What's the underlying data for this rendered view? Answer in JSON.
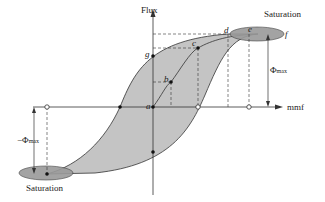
{
  "diagram": {
    "type": "hysteresis-loop",
    "axes": {
      "y_label": "Flux",
      "x_label": "mmf"
    },
    "points": [
      "a",
      "b",
      "c",
      "d",
      "e",
      "f",
      "g"
    ],
    "annotations": {
      "saturation_top": "Saturation",
      "saturation_bottom": "Saturation",
      "phi_max": "Φ",
      "phi_max_sub": "max",
      "neg_phi_max": "−Φ",
      "neg_phi_max_sub": "max"
    },
    "colors": {
      "loop_fill": "#c4c4c4",
      "ellipse_fill": "#9a9a9a",
      "line": "#333333"
    }
  }
}
